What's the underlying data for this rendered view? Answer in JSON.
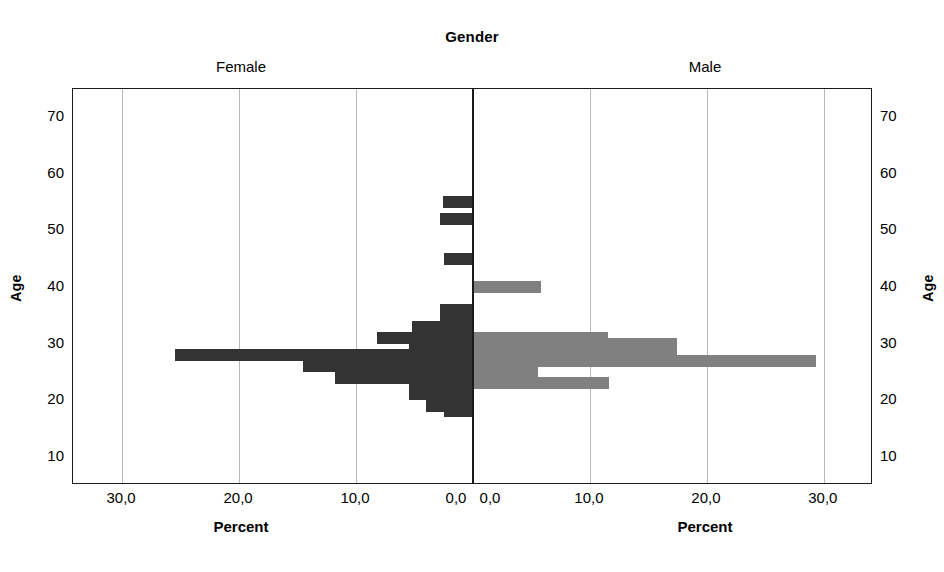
{
  "chart_data": {
    "type": "bar",
    "title": "Gender",
    "subtitle": "",
    "orientation": "horizontal",
    "layout": "population-pyramid",
    "panels": [
      {
        "name": "female",
        "caption": "Female",
        "xlabel": "Percent",
        "ylabel": "Age",
        "direction": "left",
        "color": "#333333",
        "xticks": [
          "30,0",
          "20,0",
          "10,0",
          "0,0"
        ],
        "xtick_values": [
          30.0,
          20.0,
          10.0,
          0.0
        ],
        "xlim": [
          0,
          34.2
        ],
        "ages": [
          55,
          52,
          45,
          36,
          34,
          33,
          31,
          29,
          28,
          26,
          24,
          22,
          21,
          19,
          18
        ],
        "values": [
          2.6,
          2.8,
          2.5,
          2.8,
          2.8,
          5.2,
          8.2,
          5.5,
          25.5,
          14.5,
          11.8,
          5.5,
          5.5,
          4.0,
          2.5
        ]
      },
      {
        "name": "male",
        "caption": "Male",
        "xlabel": "Percent",
        "ylabel": "Age",
        "direction": "right",
        "color": "#808080",
        "xticks": [
          "0,0",
          "10,0",
          "20,0",
          "30,0"
        ],
        "xtick_values": [
          0.0,
          10.0,
          20.0,
          30.0
        ],
        "xlim": [
          0,
          34.2
        ],
        "ages": [
          40,
          31,
          30,
          28,
          27,
          25,
          23
        ],
        "values": [
          5.8,
          11.5,
          17.4,
          17.4,
          29.3,
          5.6,
          11.6
        ]
      }
    ],
    "yticks": [
      "70",
      "60",
      "50",
      "40",
      "30",
      "20",
      "10"
    ],
    "ytick_values": [
      70,
      60,
      50,
      40,
      30,
      20,
      10
    ],
    "ylim": [
      5,
      75
    ],
    "ylabel": "Age",
    "grid": "vertical",
    "legend": "none",
    "decimal_separator": ",",
    "colors": {
      "female_bar": "#333333",
      "male_bar": "#808080",
      "gridline": "#b8b8b8",
      "axis": "#1a1a1a",
      "background": "#ffffff"
    }
  }
}
